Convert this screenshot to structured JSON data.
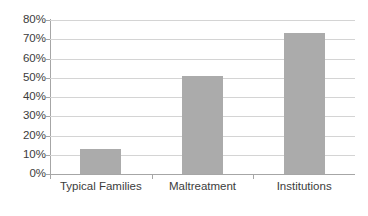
{
  "chart_data": {
    "type": "bar",
    "title": "",
    "subtitle": "",
    "xlabel": "",
    "ylabel": "",
    "categories": [
      "Typical Families",
      "Maltreatment",
      "Institutions"
    ],
    "values": [
      13,
      51,
      73.5
    ],
    "value_labels": [
      "13%",
      "51%",
      "73.5%"
    ],
    "series": [
      {
        "name": "",
        "values": [
          13,
          51,
          73.5
        ]
      }
    ],
    "ylim": [
      0,
      80
    ],
    "ytick_step": 10,
    "ytick_labels": [
      "0%",
      "10%",
      "20%",
      "30%",
      "40%",
      "50%",
      "60%",
      "70%",
      "80%"
    ],
    "ytick_values": [
      0,
      10,
      20,
      30,
      40,
      50,
      60,
      70,
      80
    ],
    "grid": true,
    "grid_axis": "y",
    "legend": false,
    "legend_position": "none",
    "colors": {
      "bar_fill": "#ababab",
      "gridline": "#d4d4d4",
      "axis_line": "#a6a6a6",
      "text": "#3c3c3c",
      "background": "#ffffff"
    }
  }
}
